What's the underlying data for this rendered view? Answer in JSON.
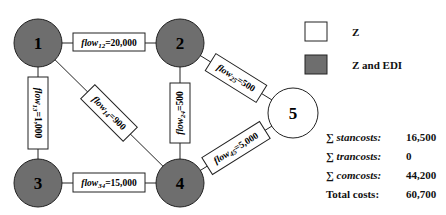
{
  "colors": {
    "node_edi_fill": "#6e6e6e",
    "node_z_fill": "#ffffff",
    "stroke": "#222222"
  },
  "nodes": [
    {
      "id": "1",
      "label": "1",
      "type": "Z and EDI"
    },
    {
      "id": "2",
      "label": "2",
      "type": "Z and EDI"
    },
    {
      "id": "3",
      "label": "3",
      "type": "Z and EDI"
    },
    {
      "id": "4",
      "label": "4",
      "type": "Z and EDI"
    },
    {
      "id": "5",
      "label": "5",
      "type": "Z"
    }
  ],
  "edges": [
    {
      "from": "1",
      "to": "2",
      "name": "flow",
      "sub": "12",
      "value": "=20,000"
    },
    {
      "from": "1",
      "to": "3",
      "name": "flow",
      "sub": "13",
      "value": "=1,000"
    },
    {
      "from": "1",
      "to": "4",
      "name": "flow",
      "sub": "14",
      "value": "=900"
    },
    {
      "from": "2",
      "to": "4",
      "name": "flow",
      "sub": "24",
      "value": "=500"
    },
    {
      "from": "2",
      "to": "5",
      "name": "flow",
      "sub": "25",
      "value": "=500"
    },
    {
      "from": "3",
      "to": "4",
      "name": "flow",
      "sub": "34",
      "value": "=15,000"
    },
    {
      "from": "4",
      "to": "5",
      "name": "flow",
      "sub": "45",
      "value": "=5,000"
    }
  ],
  "legend": {
    "items": [
      {
        "label": "Z"
      },
      {
        "label": "Z and EDI"
      }
    ]
  },
  "summary": {
    "rows": [
      {
        "sigma": "∑ ",
        "label": "stancosts:",
        "value": "16,500"
      },
      {
        "sigma": "∑ ",
        "label": "trancosts:",
        "value": "0"
      },
      {
        "sigma": "∑ ",
        "label": "comcosts:",
        "value": "44,200"
      },
      {
        "sigma": "",
        "label": "Total costs:",
        "value": "60,700"
      }
    ]
  }
}
